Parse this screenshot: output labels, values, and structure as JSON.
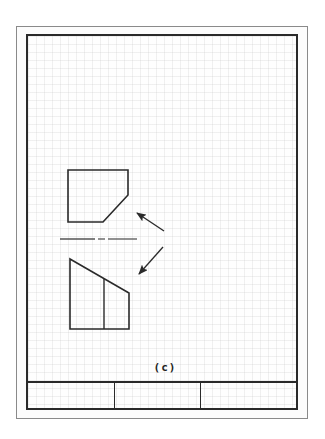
{
  "drawing": {
    "caption": "(c)",
    "line_color": "#2a2a2a",
    "grid_spacing_px": 8,
    "views": [
      {
        "name": "top-view",
        "shape": "pentagon-with-chamfered-corner"
      },
      {
        "name": "front-view",
        "shape": "trapezoid-with-inner-vertical-line"
      }
    ],
    "arrows": [
      {
        "name": "arrow-upper",
        "direction": "up-left"
      },
      {
        "name": "arrow-lower",
        "direction": "down-left"
      }
    ],
    "center_line": "dashed-center-line"
  },
  "title_block": {
    "cells": [
      "",
      "",
      ""
    ]
  }
}
